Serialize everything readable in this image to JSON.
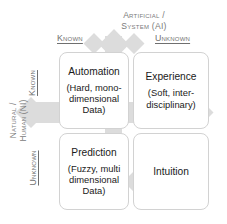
{
  "diagram": {
    "top_axis_label": "Artificial /\nSystem (AI)",
    "left_axis_label": "Natural /\nHuman (NI)",
    "column_headers": [
      {
        "id": "known",
        "label": "Known"
      },
      {
        "id": "unknown",
        "label": "Unknown"
      }
    ],
    "row_headers": [
      {
        "id": "known",
        "label": "Known"
      },
      {
        "id": "unknown",
        "label": "Unknown"
      }
    ],
    "quadrants": [
      {
        "id": "automation",
        "title": "Automation",
        "subtitle": "(Hard, mono-\ndimensional\nData)",
        "row": "known",
        "column": "known"
      },
      {
        "id": "experience",
        "title": "Experience",
        "subtitle": "(Soft, inter-\ndisciplinary)",
        "row": "known",
        "column": "unknown"
      },
      {
        "id": "prediction",
        "title": "Prediction",
        "subtitle": "(Fuzzy, multi\ndimensional\nData)",
        "row": "unknown",
        "column": "known"
      },
      {
        "id": "intuition",
        "title": "Intuition",
        "subtitle": "",
        "row": "unknown",
        "column": "unknown"
      }
    ],
    "colors": {
      "background": "#ffffff",
      "box_border": "#d2d2d2",
      "box_fill": "#ffffff",
      "cross_arrow": "#dcdcdc",
      "heading_text": "#6f6f6f",
      "axis_text": "#7b7b7b",
      "body_text": "#1a1a1a"
    }
  }
}
